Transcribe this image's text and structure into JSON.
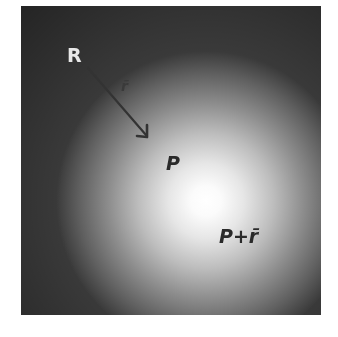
{
  "figure": {
    "labels": {
      "point_r": "R",
      "vector_r": "r̄",
      "point_p": "P",
      "point_p_plus_r": "P+r̄"
    },
    "arrow": {
      "from_label": "R",
      "to_label": "P",
      "color": "#333333"
    },
    "colors": {
      "background": "#ffffff",
      "gradient_center": "#ffffff",
      "gradient_edge": "#2a2a2a",
      "light_text": "#e8e8e8",
      "dark_text": "#2a2a2a"
    }
  }
}
